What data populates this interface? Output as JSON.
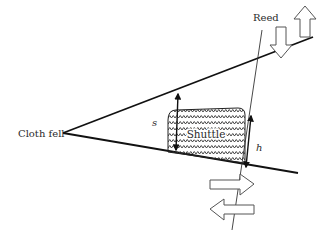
{
  "diagram": {
    "labels": {
      "cloth_fell": "Cloth fell",
      "reed": "Reed",
      "shuttle": "Shuttle",
      "s": "s",
      "h": "h"
    },
    "colors": {
      "line": "#111111",
      "text": "#2a2a2a",
      "arrow_outline": "#555555",
      "background": "#ffffff"
    },
    "geometry": {
      "apex": [
        63,
        133
      ],
      "upper_shed_end": [
        313,
        37
      ],
      "lower_shed_end": [
        298,
        173
      ],
      "reed_top": [
        262,
        30
      ],
      "reed_bottom": [
        232,
        230
      ]
    },
    "motion_arrows": {
      "reed_vertical": [
        "down",
        "up"
      ],
      "reed_horizontal": [
        "right",
        "left"
      ]
    }
  }
}
